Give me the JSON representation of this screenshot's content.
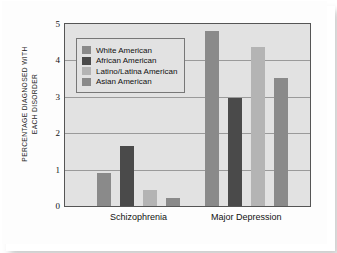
{
  "chart_data": {
    "type": "bar",
    "title": "",
    "xlabel": "",
    "ylabel": "PERCENTAGE DIAGNOSED WITH\nEACH DISORDER",
    "ylim": [
      0,
      5
    ],
    "yticks": [
      "0",
      "1",
      "2",
      "3",
      "4",
      "5"
    ],
    "grid": true,
    "legend_position": "inside-top-left",
    "categories": [
      "Schizophrenia",
      "Major Depression"
    ],
    "series": [
      {
        "name": "White American",
        "color": "#8a8a8a",
        "values": [
          0.92,
          4.82
        ]
      },
      {
        "name": "African American",
        "color": "#4a4a4a",
        "values": [
          1.65,
          2.97
        ]
      },
      {
        "name": "Latino/Latina American",
        "color": "#b4b4b4",
        "values": [
          0.45,
          4.38
        ]
      },
      {
        "name": "Asian American",
        "color": "#8a8a8a",
        "values": [
          0.21,
          3.52
        ]
      }
    ]
  },
  "colors": {
    "plot_background": "#e2e2e2",
    "gridline": "#9a9a9a",
    "axis": "#555555",
    "legend_background": "#e2e2e2",
    "legend_border": "#777777"
  }
}
